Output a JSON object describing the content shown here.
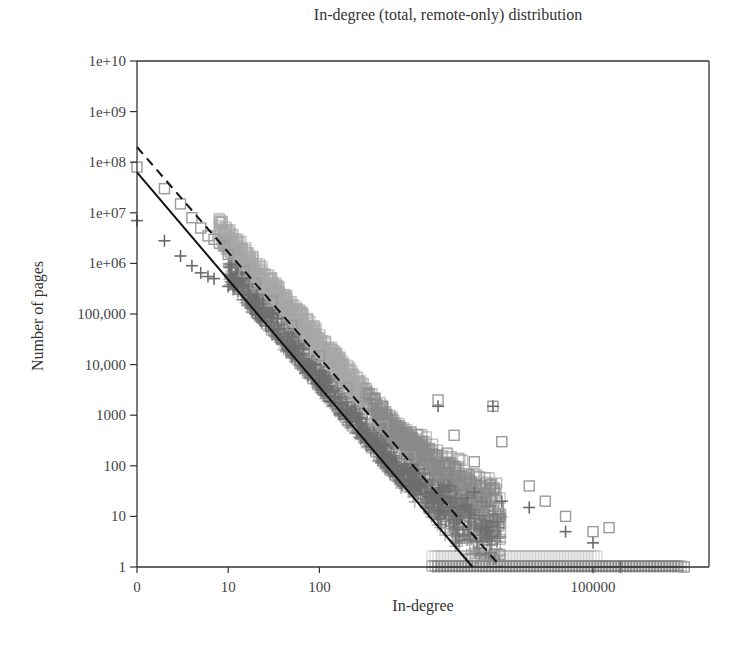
{
  "chart_data": {
    "type": "scatter",
    "title": "In-degree (total, remote-only) distribution",
    "xlabel": "In-degree",
    "ylabel": "Number of pages",
    "x_scale": "log",
    "y_scale": "log",
    "xlim": [
      1,
      1000000
    ],
    "ylim": [
      1,
      10000000000
    ],
    "grid": false,
    "legend": null,
    "x_ticks": [
      {
        "value": 1,
        "label": "0"
      },
      {
        "value": 10,
        "label": "10"
      },
      {
        "value": 100,
        "label": "100"
      },
      {
        "value": 100000,
        "label": "100000"
      }
    ],
    "y_ticks": [
      {
        "value": 1,
        "label": "1"
      },
      {
        "value": 10,
        "label": "10"
      },
      {
        "value": 100,
        "label": "100"
      },
      {
        "value": 1000,
        "label": "1000"
      },
      {
        "value": 10000,
        "label": "10,000"
      },
      {
        "value": 100000,
        "label": "100,000"
      },
      {
        "value": 1000000,
        "label": "1e+06"
      },
      {
        "value": 10000000,
        "label": "1e+07"
      },
      {
        "value": 100000000,
        "label": "1e+08"
      },
      {
        "value": 1000000000,
        "label": "1e+09"
      },
      {
        "value": 10000000000,
        "label": "1e+10"
      }
    ],
    "series": [
      {
        "name": "total",
        "marker": "square",
        "color": "#9a9a9a",
        "points": [
          [
            1,
            80000000
          ],
          [
            2,
            30000000
          ],
          [
            3,
            15000000
          ],
          [
            4,
            8000000
          ],
          [
            5,
            5000000
          ],
          [
            6,
            3500000
          ],
          [
            7,
            3000000
          ],
          [
            8,
            2500000
          ],
          [
            9,
            2200000
          ],
          [
            10,
            1500000
          ],
          [
            15,
            700000
          ],
          [
            20,
            400000
          ],
          [
            30,
            180000
          ],
          [
            50,
            60000
          ],
          [
            100,
            15000
          ],
          [
            200,
            3500
          ],
          [
            300,
            1500
          ],
          [
            500,
            600
          ],
          [
            1000,
            150
          ],
          [
            2000,
            2000
          ],
          [
            3000,
            400
          ],
          [
            5000,
            120
          ],
          [
            8000,
            1500
          ],
          [
            10000,
            300
          ],
          [
            20000,
            40
          ],
          [
            30000,
            20
          ],
          [
            50000,
            10
          ],
          [
            100000,
            5
          ],
          [
            150000,
            6
          ],
          [
            1000000,
            1
          ]
        ]
      },
      {
        "name": "remote-only",
        "marker": "plus",
        "color": "#6a6a6a",
        "points": [
          [
            1,
            7000000
          ],
          [
            2,
            2800000
          ],
          [
            3,
            1400000
          ],
          [
            4,
            900000
          ],
          [
            5,
            650000
          ],
          [
            6,
            550000
          ],
          [
            7,
            500000
          ],
          [
            10,
            350000
          ],
          [
            20,
            100000
          ],
          [
            50,
            15000
          ],
          [
            100,
            4000
          ],
          [
            200,
            1000
          ],
          [
            500,
            150
          ],
          [
            1000,
            40
          ],
          [
            2000,
            1500
          ],
          [
            5000,
            30
          ],
          [
            8000,
            1500
          ],
          [
            10000,
            20
          ],
          [
            20000,
            15
          ],
          [
            50000,
            5
          ],
          [
            100000,
            3
          ],
          [
            200000,
            1
          ]
        ]
      }
    ],
    "fits": [
      {
        "name": "total-fit",
        "style": "dashed",
        "color": "#111111",
        "intercept_log10": 8.3,
        "slope": -2.08
      },
      {
        "name": "remote-only-fit",
        "style": "solid",
        "color": "#111111",
        "intercept_log10": 7.8,
        "slope": -2.12
      }
    ]
  }
}
